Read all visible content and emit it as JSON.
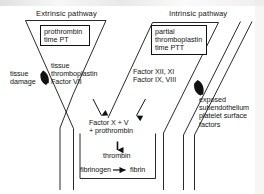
{
  "diagram": {
    "headers": {
      "extrinsic": "Extrinsic pathway",
      "intrinsic": "Intrinsic pathway"
    },
    "boxes": {
      "pt": "prothrombin\ntime PT",
      "ptt": "partial\nthromboplastin\ntime PTT"
    },
    "labels": {
      "tissue_damage": "tissue\ndamage",
      "tissue_thromboplastin": "tissue\nthromboplastin\nFactor VII",
      "factors_intrinsic": "Factor XII, XI\nFactor IX, VIII",
      "exposed_surface": "exposed\nsubendothelium\nplatelet surface\nfactors",
      "factor_x_v": "Factor X + V\n+ prothrombin",
      "thrombin": "thrombin",
      "fibrinogen": "fibrinogen",
      "fibrin": "fibrin"
    },
    "colors": {
      "line": "#111111",
      "text": "#141414",
      "background": "#ffffff"
    }
  }
}
